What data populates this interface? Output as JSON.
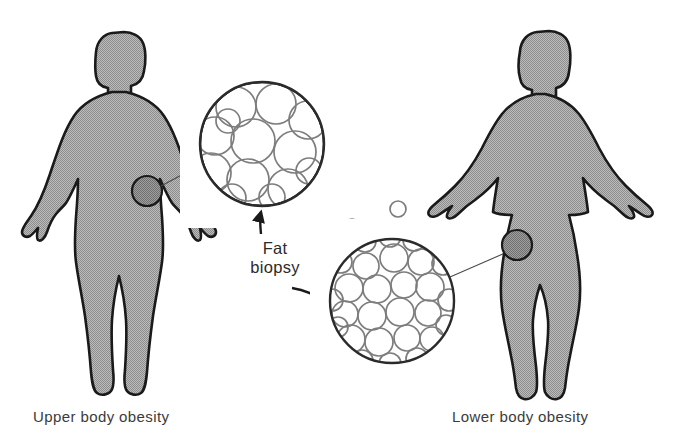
{
  "figure": {
    "background_color": "#ffffff",
    "body_fill_color": "#a8a8a8",
    "body_outline_color": "#1a1a1a",
    "biopsy_marker_color": "#8e8e8e",
    "cell_outline_color": "#7d7d7d",
    "circle_outline_color": "#2b2b2b",
    "text_color": "#3b3b3b"
  },
  "center_label": {
    "line1": "Fat",
    "line2": "biopsy"
  },
  "panels": [
    {
      "id": "upper-body",
      "caption": "Upper body obesity",
      "biopsy_site": "abdomen",
      "cell_pattern": "hypertrophic",
      "cell_count": 13,
      "cell_description": "few large fat cells"
    },
    {
      "id": "lower-body",
      "caption": "Lower body obesity",
      "biopsy_site": "upper thigh",
      "cell_pattern": "hyperplastic",
      "cell_count": 30,
      "cell_description": "many small fat cells"
    }
  ],
  "icons": {
    "arrow_up": "arrow-up-icon",
    "arrow_curved": "curved-arrow-icon",
    "leader_line": "leader-line-icon"
  },
  "cells": {
    "upper": [
      {
        "cx": 236,
        "cy": 107,
        "r": 20
      },
      {
        "cx": 276,
        "cy": 104,
        "r": 20
      },
      {
        "cx": 308,
        "cy": 120,
        "r": 19
      },
      {
        "cx": 215,
        "cy": 136,
        "r": 19
      },
      {
        "cx": 253,
        "cy": 141,
        "r": 22
      },
      {
        "cx": 295,
        "cy": 152,
        "r": 21
      },
      {
        "cx": 211,
        "cy": 173,
        "r": 20
      },
      {
        "cx": 248,
        "cy": 180,
        "r": 21
      },
      {
        "cx": 288,
        "cy": 189,
        "r": 20
      },
      {
        "cx": 228,
        "cy": 121,
        "r": 12
      },
      {
        "cx": 232,
        "cy": 198,
        "r": 14
      },
      {
        "cx": 272,
        "cy": 197,
        "r": 13
      },
      {
        "cx": 309,
        "cy": 171,
        "r": 13
      }
    ],
    "lower": [
      {
        "cx": 366,
        "cy": 266,
        "r": 13
      },
      {
        "cx": 394,
        "cy": 258,
        "r": 14
      },
      {
        "cx": 421,
        "cy": 262,
        "r": 13
      },
      {
        "cx": 349,
        "cy": 288,
        "r": 14
      },
      {
        "cx": 377,
        "cy": 289,
        "r": 14
      },
      {
        "cx": 404,
        "cy": 285,
        "r": 13
      },
      {
        "cx": 430,
        "cy": 287,
        "r": 14
      },
      {
        "cx": 345,
        "cy": 314,
        "r": 13
      },
      {
        "cx": 372,
        "cy": 316,
        "r": 14
      },
      {
        "cx": 400,
        "cy": 312,
        "r": 14
      },
      {
        "cx": 428,
        "cy": 313,
        "r": 13
      },
      {
        "cx": 351,
        "cy": 339,
        "r": 14
      },
      {
        "cx": 379,
        "cy": 342,
        "r": 14
      },
      {
        "cx": 407,
        "cy": 338,
        "r": 13
      },
      {
        "cx": 432,
        "cy": 339,
        "r": 12
      },
      {
        "cx": 365,
        "cy": 241,
        "r": 11
      },
      {
        "cx": 390,
        "cy": 236,
        "r": 11
      },
      {
        "cx": 414,
        "cy": 240,
        "r": 11
      },
      {
        "cx": 341,
        "cy": 262,
        "r": 11
      },
      {
        "cx": 443,
        "cy": 264,
        "r": 11
      },
      {
        "cx": 332,
        "cy": 300,
        "r": 11
      },
      {
        "cx": 449,
        "cy": 300,
        "r": 11
      },
      {
        "cx": 338,
        "cy": 327,
        "r": 10
      },
      {
        "cx": 446,
        "cy": 325,
        "r": 10
      },
      {
        "cx": 362,
        "cy": 361,
        "r": 11
      },
      {
        "cx": 390,
        "cy": 364,
        "r": 11
      },
      {
        "cx": 417,
        "cy": 359,
        "r": 11
      },
      {
        "cx": 430,
        "cy": 232,
        "r": 9
      },
      {
        "cx": 352,
        "cy": 228,
        "r": 9
      },
      {
        "cx": 398,
        "cy": 209,
        "r": 8
      }
    ]
  }
}
